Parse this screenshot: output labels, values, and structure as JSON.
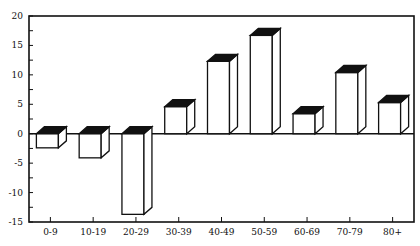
{
  "chart_data": {
    "type": "bar",
    "title": "",
    "xlabel": "",
    "ylabel": "",
    "categories": [
      "0-9",
      "10-19",
      "20-29",
      "30-39",
      "40-49",
      "50-59",
      "60-69",
      "70-79",
      "80+"
    ],
    "values": [
      -2.4,
      -4.1,
      -13.7,
      4.6,
      12.3,
      16.7,
      3.4,
      10.4,
      5.3
    ],
    "ylim": [
      -15,
      20
    ],
    "yticks": [
      -15,
      -10,
      -5,
      0,
      5,
      10,
      15,
      20
    ],
    "ytick_labels": [
      "-15",
      "-10",
      "-5",
      "0",
      "5",
      "10",
      "15",
      "20"
    ],
    "minor_ytick_step": 2.5,
    "grid": false,
    "style": "3d-bars-black-top",
    "colors": {
      "bar_fill": "#ffffff",
      "bar_top": "#111111",
      "stroke": "#111111"
    }
  }
}
